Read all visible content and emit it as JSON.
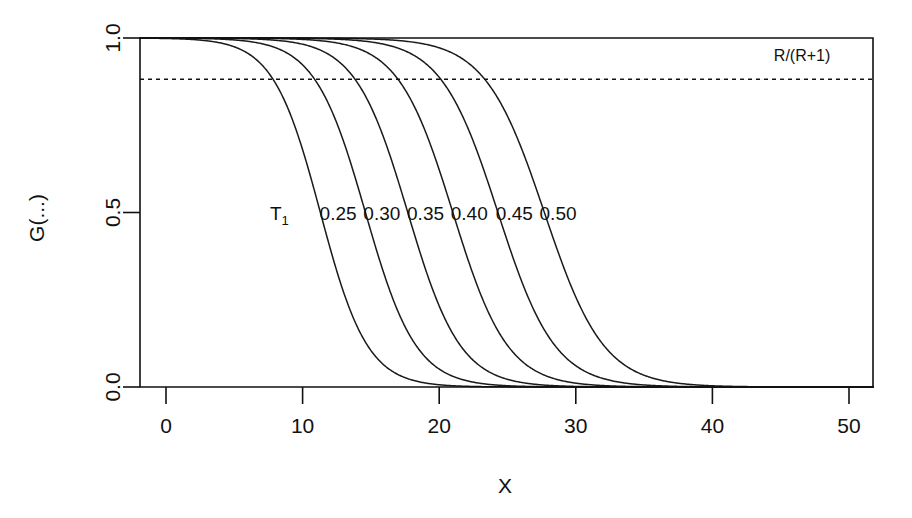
{
  "chart_data": {
    "type": "line",
    "title": "",
    "xlabel": "X",
    "ylabel": "G(...)",
    "xlim": [
      -2,
      52
    ],
    "ylim": [
      0.0,
      1.0
    ],
    "grid": false,
    "legend": "inline-curve-labels",
    "x_ticks": [
      0,
      10,
      20,
      30,
      40,
      50
    ],
    "x_tick_labels": [
      "0",
      "10",
      "20",
      "30",
      "40",
      "50"
    ],
    "y_ticks": [
      0.0,
      0.5,
      1.0
    ],
    "y_tick_labels": [
      "0.0",
      "0.5",
      "1.0"
    ],
    "annotations": [
      {
        "name": "reference-line-label",
        "text": "R/(R+1)",
        "x": 44.5,
        "y": 0.935
      },
      {
        "name": "series-group-label",
        "text": "T",
        "subscript": "1",
        "x": 8.3,
        "y": 0.5
      }
    ],
    "reference_lines": [
      {
        "name": "R-over-R-plus-1",
        "value": 0.882,
        "style": "dashed",
        "label": "R/(R+1)"
      }
    ],
    "series": [
      {
        "name": "T1 = 0.25",
        "label": "0.25",
        "label_x": 12.6,
        "label_y": 0.5,
        "midpoint_x": 11.3,
        "steepness": 0.58,
        "plateau_end_x": 7.0,
        "tail_start_x": 19.3
      },
      {
        "name": "T1 = 0.30",
        "label": "0.30",
        "label_x": 15.8,
        "label_y": 0.5,
        "midpoint_x": 14.6,
        "steepness": 0.54,
        "plateau_end_x": 10.2,
        "tail_start_x": 22.8
      },
      {
        "name": "T1 = 0.35",
        "label": "0.35",
        "label_x": 19.0,
        "label_y": 0.5,
        "midpoint_x": 17.7,
        "steepness": 0.52,
        "plateau_end_x": 13.2,
        "tail_start_x": 25.9
      },
      {
        "name": "T1 = 0.40",
        "label": "0.40",
        "label_x": 22.2,
        "label_y": 0.5,
        "midpoint_x": 21.0,
        "steepness": 0.5,
        "plateau_end_x": 16.5,
        "tail_start_x": 29.4
      },
      {
        "name": "T1 = 0.45",
        "label": "0.45",
        "label_x": 25.5,
        "label_y": 0.5,
        "midpoint_x": 24.3,
        "steepness": 0.48,
        "plateau_end_x": 19.7,
        "tail_start_x": 32.7
      },
      {
        "name": "T1 = 0.50",
        "label": "0.50",
        "label_x": 28.7,
        "label_y": 0.5,
        "midpoint_x": 27.7,
        "steepness": 0.46,
        "plateau_end_x": 23.0,
        "tail_start_x": 36.2
      }
    ]
  },
  "figure": {
    "background_color": "#ffffff",
    "line_color": "#1a1a1a",
    "axis_color": "#111111"
  }
}
